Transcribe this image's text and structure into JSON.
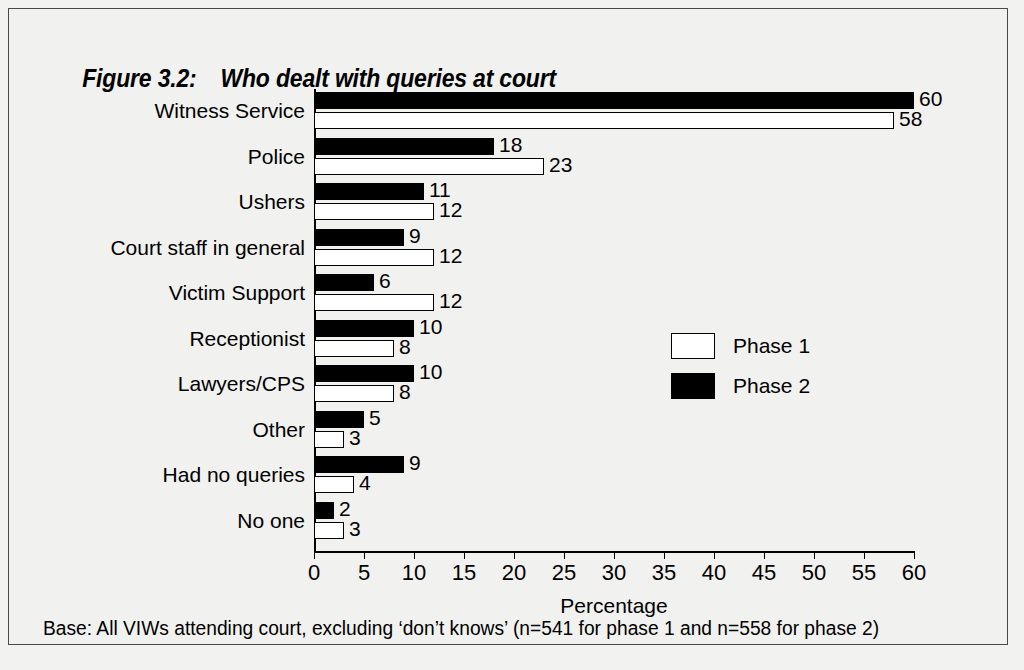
{
  "title": {
    "number": "Figure 3.2:",
    "text": "Who dealt with queries at court"
  },
  "footnote": "Base:  All VIWs attending court, excluding ‘don’t knows’ (n=541 for phase 1 and n=558 for phase 2)",
  "legend": {
    "items": [
      {
        "label": "Phase 1",
        "color": "#ffffff",
        "key": "phase1"
      },
      {
        "label": "Phase 2",
        "color": "#000000",
        "key": "phase2"
      }
    ]
  },
  "chart_data": {
    "type": "bar",
    "orientation": "horizontal",
    "title": "Who dealt with queries at court",
    "xlabel": "Percentage",
    "ylabel": "",
    "xlim": [
      0,
      60
    ],
    "xticks": [
      0,
      5,
      10,
      15,
      20,
      25,
      30,
      35,
      40,
      45,
      50,
      55,
      60
    ],
    "grid": false,
    "legend_position": "center-right",
    "categories": [
      "Witness Service",
      "Police",
      "Ushers",
      "Court staff in general",
      "Victim Support",
      "Receptionist",
      "Lawyers/CPS",
      "Other",
      "Had no queries",
      "No one"
    ],
    "series": [
      {
        "name": "Phase 1",
        "color": "#ffffff",
        "values": [
          58,
          23,
          12,
          12,
          12,
          8,
          8,
          3,
          4,
          3
        ]
      },
      {
        "name": "Phase 2",
        "color": "#000000",
        "values": [
          60,
          18,
          11,
          9,
          6,
          10,
          10,
          5,
          9,
          2
        ]
      }
    ]
  }
}
